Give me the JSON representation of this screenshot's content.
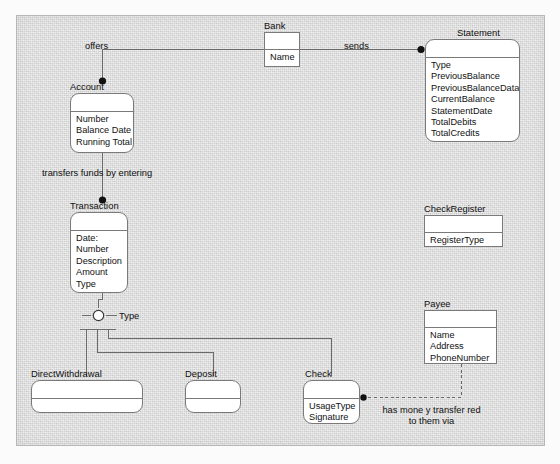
{
  "diagram": {
    "background_color": "#d7d7d7",
    "frame_border_color": "#b7b7b7",
    "box_fill": "#ffffff",
    "box_border": "#7a7a7a",
    "line_color": "#6a6a6a"
  },
  "classes": [
    {
      "id": "bank",
      "name": "Bank",
      "shape": "sharp",
      "attributes": [
        "Name"
      ]
    },
    {
      "id": "statement",
      "name": "Statement",
      "shape": "rounded",
      "attributes": [
        "Type",
        "PreviousBalance",
        "PreviousBalanceData",
        "CurrentBalance",
        "StatementDate",
        "TotalDebits",
        "TotalCredits",
        "BalancingItems"
      ]
    },
    {
      "id": "account",
      "name": "Account",
      "shape": "rounded",
      "attributes": [
        "Number",
        "Balance Date",
        "Running Total"
      ]
    },
    {
      "id": "transaction",
      "name": "Transaction",
      "shape": "rounded",
      "attributes": [
        "Date:",
        "Number",
        "Description",
        "Amount",
        "Type"
      ]
    },
    {
      "id": "checkregister",
      "name": "CheckRegister",
      "shape": "sharp",
      "attributes": [
        "RegisterType"
      ]
    },
    {
      "id": "payee",
      "name": "Payee",
      "shape": "sharp",
      "attributes": [
        "Name",
        "Address",
        "PhoneNumber"
      ]
    },
    {
      "id": "directwithdrawal",
      "name": "DirectWithdrawal",
      "shape": "rounded",
      "attributes": []
    },
    {
      "id": "deposit",
      "name": "Deposit",
      "shape": "rounded",
      "attributes": []
    },
    {
      "id": "check",
      "name": "Check",
      "shape": "rounded",
      "attributes": [
        "UsageType",
        "Signature"
      ]
    }
  ],
  "associations": [
    {
      "id": "offers",
      "label": "offers",
      "from": "bank",
      "to": "account",
      "style": "solid"
    },
    {
      "id": "sends",
      "label": "sends",
      "from": "bank",
      "to": "statement",
      "style": "solid"
    },
    {
      "id": "transfers",
      "label": "transfers funds  by entering",
      "from": "account",
      "to": "transaction",
      "style": "solid"
    },
    {
      "id": "payeelink",
      "label_line1": "has mone y transfer red",
      "label_line2": "to them via",
      "from": "payee",
      "to": "check",
      "style": "dashed"
    }
  ],
  "generalization": {
    "discriminator": "Type",
    "parent": "transaction",
    "children": [
      "directwithdrawal",
      "deposit",
      "check"
    ]
  }
}
